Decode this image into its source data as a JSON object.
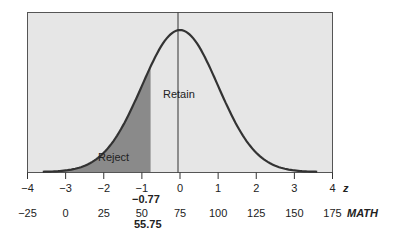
{
  "chart_data": {
    "type": "area",
    "title": "",
    "curve": "normal",
    "mean_z": 0,
    "sd_z": 1,
    "z_axis": {
      "label": "z",
      "ticks": [
        -4,
        -3,
        -2,
        -1,
        0,
        1,
        2,
        3,
        4
      ],
      "tick_labels": [
        "−4",
        "−3",
        "−2",
        "−1",
        "0",
        "1",
        "2",
        "3",
        "4"
      ],
      "range": [
        -4,
        4
      ]
    },
    "math_axis": {
      "label": "MATH",
      "ticks": [
        -25,
        0,
        25,
        50,
        75,
        100,
        125,
        150,
        175
      ],
      "tick_labels": [
        "−25",
        "0",
        "25",
        "50",
        "75",
        "100",
        "125",
        "150",
        "175"
      ]
    },
    "critical_value": {
      "z": -0.77,
      "z_label": "−0.77",
      "math": 55.75,
      "math_label": "55.75"
    },
    "regions": [
      {
        "name": "Reject",
        "from_z": -4,
        "to_z": -0.77,
        "shaded": true
      },
      {
        "name": "Retain",
        "from_z": -0.77,
        "to_z": 4,
        "shaded": false
      }
    ],
    "colors": {
      "background": "#e6e6e6",
      "reject_fill": "#8a8a8a",
      "curve": "#333333"
    }
  },
  "labels": {
    "retain": "Retain",
    "reject": "Reject",
    "z_axis_name": "z",
    "math_axis_name": "MATH",
    "critical_z": "−0.77",
    "critical_math": "55.75",
    "z_ticks": [
      "−4",
      "−3",
      "−2",
      "−1",
      "0",
      "1",
      "2",
      "3",
      "4"
    ],
    "math_ticks": [
      "−25",
      "0",
      "25",
      "50",
      "75",
      "100",
      "125",
      "150",
      "175"
    ]
  }
}
